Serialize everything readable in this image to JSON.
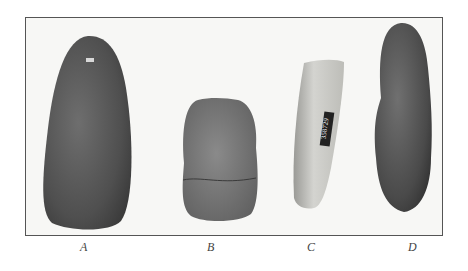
{
  "plate": {
    "specimens": [
      {
        "id": "A",
        "label": "A",
        "description": "large oval dark stone pestle/celt",
        "tone": "#5e5e5e"
      },
      {
        "id": "B",
        "label": "B",
        "description": "short broken stone with crack line",
        "tone": "#7a7a7a"
      },
      {
        "id": "C",
        "label": "C",
        "description": "light slender curved stone with catalog tag",
        "tone": "#c4c4c0",
        "tag_text": "358729"
      },
      {
        "id": "D",
        "label": "D",
        "description": "dark elongated stone pestle",
        "tone": "#575757"
      }
    ]
  }
}
